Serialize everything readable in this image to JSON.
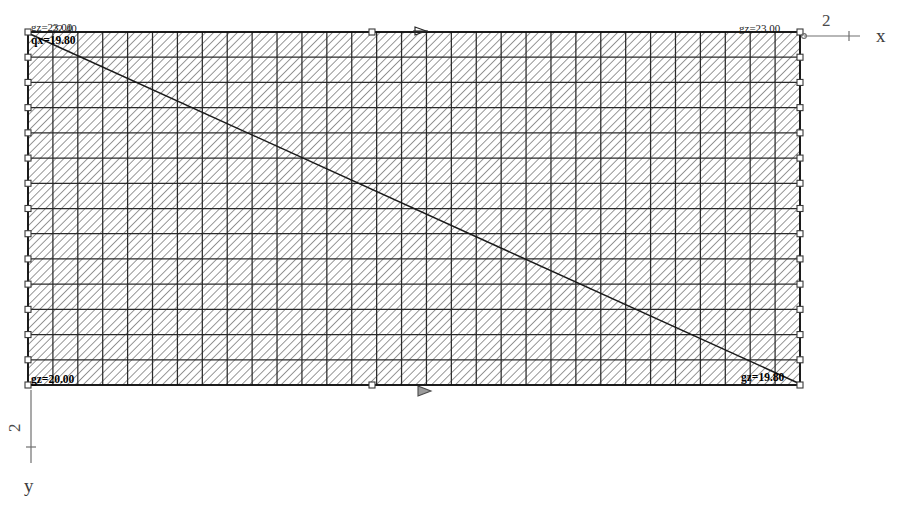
{
  "drawing": {
    "title": "Structural mesh plot",
    "background_color": "#ffffff",
    "line_color": "#1a1a1a",
    "hatch_color": "#6e6e6e",
    "grid_color": "#2a2a2a",
    "axis_color": "#6a6a6a",
    "marker_color": "#3a3a3a"
  },
  "mesh": {
    "x_left": 28,
    "x_right": 800,
    "y_top": 32,
    "y_bottom": 385,
    "grid_cols": 31,
    "grid_rows": 14,
    "hatch_angle_deg": 45,
    "hatch_spacing_px": 4
  },
  "corner_labels": {
    "top_left_upper": "gz=23.00",
    "top_left_over": "22.40",
    "top_left_lower": "qx=19.80",
    "top_right": "gz=23.00",
    "bottom_left": "gz=20.00",
    "bottom_right": "gz=19.80"
  },
  "diagonal": {
    "from_x": 30,
    "from_y": 34,
    "to_x": 798,
    "to_y": 383
  },
  "axes": {
    "x": {
      "label": "x",
      "tick_value": "2",
      "origin_x": 804,
      "origin_y": 36,
      "end_x": 860,
      "end_y": 36,
      "label_x": 876,
      "label_y": 42,
      "num_x": 822,
      "num_y": 26,
      "tick_at_x": 849
    },
    "y": {
      "label": "y",
      "tick_value": "2",
      "origin_x": 31,
      "origin_y": 390,
      "end_x": 31,
      "end_y": 463,
      "label_x": 24,
      "label_y": 492,
      "num_x": 20,
      "num_y": 432,
      "tick_at_y": 447
    }
  },
  "markers": {
    "edge_node_size": 6,
    "top_center_x": 372,
    "bottom_center_x": 372,
    "load_arrow_top_x": 415,
    "load_arrow_bottom_x": 418
  }
}
